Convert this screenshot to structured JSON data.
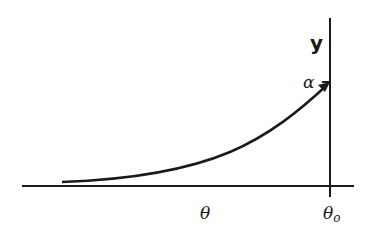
{
  "diagram": {
    "type": "curve-plot",
    "y_axis_label": "y",
    "x_axis_label": "θ",
    "x_marker_label": "θₒ",
    "y_marker_label": "α",
    "curve": "increasing convex curve from near x-axis rising to point (θo, α) with arrowhead",
    "colors": {
      "stroke": "#1a1a1a",
      "background": "#ffffff"
    }
  },
  "labels": {
    "y": "y",
    "theta": "θ",
    "theta0_main": "θ",
    "theta0_sub": "o",
    "alpha": "α"
  }
}
